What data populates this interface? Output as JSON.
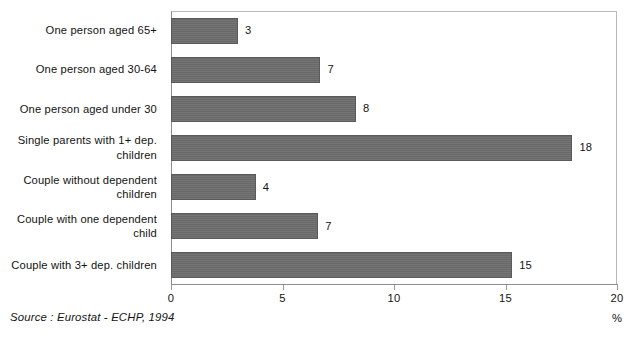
{
  "chart_data": {
    "type": "bar",
    "orientation": "horizontal",
    "title": "",
    "xlabel": "%",
    "ylabel": "",
    "xlim": [
      0,
      20
    ],
    "grid": false,
    "legend": null,
    "categories": [
      "One person aged 65+",
      "One person aged 30-64",
      "One person aged under 30",
      "Single parents with 1+ dep.\nchildren",
      "Couple without dependent children",
      "Couple with one dependent child",
      "Couple with 3+ dep. children"
    ],
    "values": [
      3,
      7,
      8,
      18,
      4,
      7,
      15
    ],
    "value_labels": [
      "3",
      "7",
      "8",
      "18",
      "4",
      "7",
      "15"
    ],
    "bar_lengths_units": [
      3.0,
      6.7,
      8.3,
      18.0,
      3.8,
      6.6,
      15.3
    ],
    "xticks": [
      0,
      5,
      10,
      15,
      20
    ],
    "xtick_labels": [
      "0",
      "5",
      "10",
      "15",
      "20"
    ],
    "bar_color": "#6d6d6d",
    "bar_border_color": "#5a5a5a",
    "frame_color": "#b9b9b9",
    "axis_color": "#8d8d8d",
    "source": "Source : Eurostat - ECHP, 1994"
  }
}
